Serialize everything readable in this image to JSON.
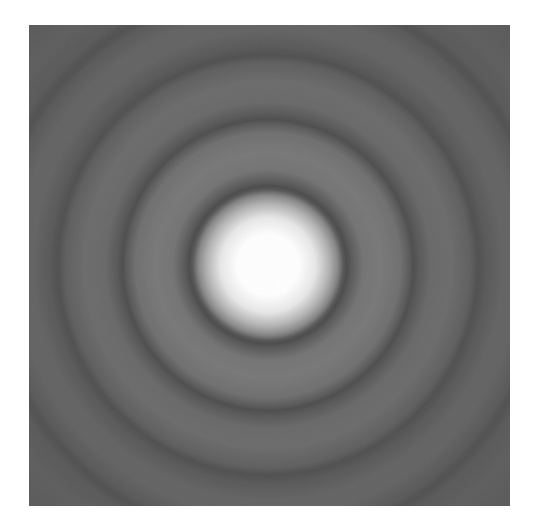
{
  "figure": {
    "description": "Airy diffraction pattern: bright central disk surrounded by concentric dark and light rings on grey background",
    "frame": {
      "x": 29,
      "y": 25,
      "width": 481,
      "height": 481
    },
    "center": {
      "x": 239,
      "y": 240
    },
    "colors": {
      "core": "#ffffff",
      "background": "#5e5e5e",
      "bright_ring": "#7a7a7a",
      "dark_ring": "#505050",
      "paper": "#ffffff"
    },
    "central_disk": {
      "white_core_radius": 35,
      "fade_radius": 70
    },
    "dark_rings": [
      {
        "index": 1,
        "radius": 75,
        "width": 10
      },
      {
        "index": 2,
        "radius": 145,
        "width": 12
      },
      {
        "index": 3,
        "radius": 210,
        "width": 14
      },
      {
        "index": 4,
        "radius": 275,
        "width": 16
      }
    ]
  }
}
